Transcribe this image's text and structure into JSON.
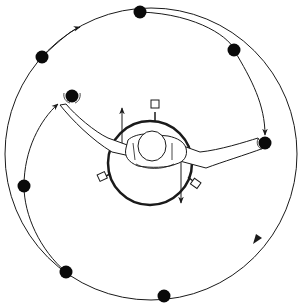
{
  "diagram": {
    "title": "Overhead view of figure on rotating platform with hand-held weights",
    "colors": {
      "line": "#1a1a1a",
      "background": "#ffffff",
      "dot": "#0a0a0a"
    },
    "outer_circle": {
      "cx": 151,
      "cy": 154,
      "r": 146
    },
    "platform": {
      "cx": 150,
      "cy": 163,
      "r": 42
    },
    "orbit_dots": [
      {
        "id": "dot-top",
        "x": 140,
        "y": 12
      },
      {
        "id": "dot-upper-right",
        "x": 234,
        "y": 50
      },
      {
        "id": "dot-upper-left",
        "x": 42,
        "y": 57
      },
      {
        "id": "dot-left",
        "x": 24,
        "y": 186
      },
      {
        "id": "dot-lower-left",
        "x": 66,
        "y": 272
      },
      {
        "id": "dot-bottom",
        "x": 164,
        "y": 296
      }
    ],
    "hand_weights": [
      {
        "id": "left-hand-weight",
        "x": 72,
        "y": 96
      },
      {
        "id": "right-hand-weight",
        "x": 265,
        "y": 143
      }
    ],
    "labels": []
  }
}
